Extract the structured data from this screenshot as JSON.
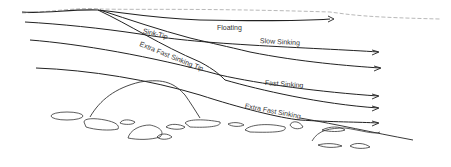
{
  "diagram": {
    "type": "fly-line-sink-rates",
    "labels": {
      "floating": "Floating",
      "slow_sinking": "Slow Sinking",
      "fast_sinking": "Fast Sinking",
      "extra_fast_sinking": "Extra Fast Sinking",
      "sink_tip": "Sink-Tip",
      "extra_fast_sinking_tip": "Extra Fast Sinking Tip"
    },
    "colors": {
      "line": "#222222",
      "water_surface": "#999999",
      "rocks": "#333333",
      "text": "#333333"
    }
  }
}
